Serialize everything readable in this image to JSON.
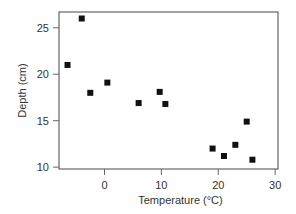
{
  "chart_data": {
    "type": "scatter",
    "title": "",
    "xlabel": "Temperature (°C)",
    "ylabel": "Depth (cm)",
    "xlim": [
      -8,
      30.5
    ],
    "ylim": [
      9.8,
      26.7
    ],
    "xticks": [
      0,
      10,
      20,
      30
    ],
    "yticks": [
      10,
      15,
      20,
      25
    ],
    "grid": false,
    "legend": null,
    "marker": "square",
    "marker_color": "#111111",
    "series": [
      {
        "name": "samples",
        "points": [
          {
            "x": -6.5,
            "y": 21.0
          },
          {
            "x": -4.0,
            "y": 26.0
          },
          {
            "x": -2.5,
            "y": 18.0
          },
          {
            "x": 0.5,
            "y": 19.1
          },
          {
            "x": 6.0,
            "y": 16.9
          },
          {
            "x": 9.7,
            "y": 18.1
          },
          {
            "x": 10.7,
            "y": 16.8
          },
          {
            "x": 19.0,
            "y": 12.0
          },
          {
            "x": 21.0,
            "y": 11.2
          },
          {
            "x": 23.0,
            "y": 12.4
          },
          {
            "x": 25.0,
            "y": 14.9
          },
          {
            "x": 26.0,
            "y": 10.8
          }
        ]
      }
    ]
  },
  "layout": {
    "plot": {
      "left": 59,
      "top": 12,
      "right": 278,
      "bottom": 169
    },
    "axis_color": "#666666"
  }
}
